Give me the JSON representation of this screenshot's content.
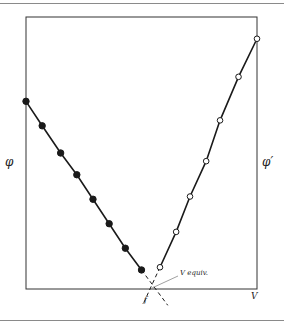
{
  "chart_data": {
    "type": "line",
    "title": "",
    "xlabel": "V",
    "ylabel_left": "φ",
    "ylabel_right": "φ′",
    "annotation": "V equiv.",
    "grid": false,
    "legend": "none",
    "series": [
      {
        "name": "φ",
        "marker": "filled-circle",
        "x": [
          0.0,
          0.07,
          0.15,
          0.22,
          0.29,
          0.36,
          0.43,
          0.5
        ],
        "y": [
          0.69,
          0.6,
          0.5,
          0.42,
          0.33,
          0.24,
          0.15,
          0.07
        ]
      },
      {
        "name": "φ′",
        "marker": "open-circle",
        "x": [
          0.58,
          0.65,
          0.71,
          0.78,
          0.84,
          0.92,
          1.0
        ],
        "y": [
          0.08,
          0.21,
          0.34,
          0.47,
          0.62,
          0.78,
          0.92
        ]
      }
    ],
    "equivalence_point": {
      "x": 0.54,
      "y": 0.0,
      "label": "V equiv."
    }
  },
  "labels": {
    "left_axis": "φ",
    "right_axis": "φ′",
    "x_axis": "V",
    "equiv": "V equiv.",
    "intersection_mark": "ƒ"
  },
  "colors": {
    "line": "#1a1a1a",
    "frame": "#333333",
    "rule": "#8a8a8a"
  }
}
